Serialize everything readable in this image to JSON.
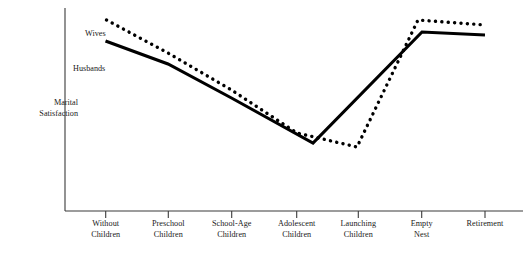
{
  "chart_data": {
    "type": "line",
    "title": "",
    "xlabel": "",
    "ylabel": "Marital\nSatisfaction",
    "ylabel_line1": "Marital",
    "ylabel_line2": "Satisfaction",
    "grid": false,
    "legend_position": "inline-left",
    "axis_ticks_shown": true,
    "y_axis_values_shown": false,
    "ylim": [
      0,
      100
    ],
    "categories": [
      "Without\nChildren",
      "Preschool\nChildren",
      "School-Age\nChildren",
      "Adolescent\nChildren",
      "Launching\nChildren",
      "Empty\nNest",
      "Retirement"
    ],
    "category_labels": [
      {
        "line1": "Without",
        "line2": "Children"
      },
      {
        "line1": "Preschool",
        "line2": "Children"
      },
      {
        "line1": "School-Age",
        "line2": "Children"
      },
      {
        "line1": "Adolescent",
        "line2": "Children"
      },
      {
        "line1": "Launching",
        "line2": "Children"
      },
      {
        "line1": "Empty",
        "line2": "Nest"
      },
      {
        "line1": "Retirement",
        "line2": ""
      }
    ],
    "series": [
      {
        "name": "Wives",
        "style": "dotted",
        "color": "#000000",
        "values": [
          94,
          78,
          60,
          38,
          31,
          94,
          92
        ]
      },
      {
        "name": "Husbands",
        "style": "solid",
        "color": "#000000",
        "values": [
          84,
          73,
          56,
          34,
          50,
          89,
          87
        ]
      }
    ],
    "annotations": [
      {
        "text": "Wives",
        "x_px": 85,
        "y_px": 30
      },
      {
        "text": "Husbands",
        "x_px": 73,
        "y_px": 64
      }
    ]
  },
  "geometry": {
    "axis_x": 65,
    "axis_top": 8,
    "axis_bottom": 211,
    "axis_right": 523,
    "tick_x": [
      105.7,
      168.3,
      231.7,
      296.7,
      358.3,
      421.7,
      485.0
    ],
    "tick_length": 7,
    "solid_points": "105.5,41 168,64 231.5,98 313,143 422,32 485,35",
    "dotted_points": "106.5,20 168,53 231.5,90 297,133 357,147 418,20 485,25",
    "label_top": 219
  },
  "colors": {
    "ink": "#000000",
    "axis": "#3a3a3a",
    "text": "#1a1a1a",
    "background": "#ffffff"
  }
}
